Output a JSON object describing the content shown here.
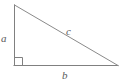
{
  "figure": {
    "name": "right-triangle-diagram",
    "background_color": "#ffffff",
    "stroke_color": "#808080",
    "label_color": "#5a5a5a",
    "stroke_width": 1,
    "width": 124,
    "height": 84
  },
  "geometry": {
    "apex": {
      "x": 14,
      "y": 5
    },
    "right_angle_vertex": {
      "x": 14,
      "y": 65
    },
    "right_vertex": {
      "x": 118,
      "y": 65
    },
    "right_angle_marker_size": 8,
    "path": "M 14 5 L 14 65 L 118 65 Z"
  },
  "labels": {
    "leg_vertical": "a",
    "leg_horizontal": "b",
    "hypotenuse": "c"
  },
  "icons": {
    "right_angle": "right-angle-marker-icon"
  }
}
